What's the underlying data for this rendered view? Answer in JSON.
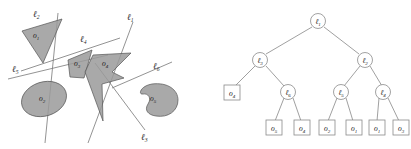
{
  "figure": {
    "left_panel": {
      "title": "bsp-arrangement",
      "objects": [
        {
          "id": "o1",
          "label": "o",
          "subscript": "1",
          "shape": "triangle",
          "x": 37,
          "y": 38
        },
        {
          "id": "o2",
          "label": "o",
          "subscript": "2",
          "shape": "ellipse",
          "x": 44,
          "y": 99
        },
        {
          "id": "o3",
          "label": "o",
          "subscript": "3",
          "shape": "triangle",
          "x": 79,
          "y": 63
        },
        {
          "id": "o4",
          "label": "o",
          "subscript": "4",
          "shape": "concave-arrow",
          "x": 107,
          "y": 63
        },
        {
          "id": "o5",
          "label": "o",
          "subscript": "5",
          "shape": "bean",
          "x": 155,
          "y": 98
        }
      ],
      "lines": [
        {
          "id": "l1",
          "label": "ℓ",
          "subscript": "1",
          "x": 131,
          "y": 17
        },
        {
          "id": "l2",
          "label": "ℓ",
          "subscript": "2",
          "x": 38,
          "y": 14
        },
        {
          "id": "l3",
          "label": "ℓ",
          "subscript": "3",
          "x": 146,
          "y": 137
        },
        {
          "id": "l4",
          "label": "ℓ",
          "subscript": "4",
          "x": 85,
          "y": 39
        },
        {
          "id": "l5",
          "label": "ℓ",
          "subscript": "5",
          "x": 17,
          "y": 69
        },
        {
          "id": "l6",
          "label": "ℓ",
          "subscript": "6",
          "x": 158,
          "y": 66
        }
      ]
    },
    "right_panel": {
      "title": "bsp-tree",
      "internal_nodes": [
        {
          "id": "n-l1",
          "label": "ℓ",
          "subscript": "1",
          "cx": 113,
          "cy": 21
        },
        {
          "id": "n-l3",
          "label": "ℓ",
          "subscript": "3",
          "cx": 55,
          "cy": 60
        },
        {
          "id": "n-l2",
          "label": "ℓ",
          "subscript": "2",
          "cx": 160,
          "cy": 60
        },
        {
          "id": "n-l6",
          "label": "ℓ",
          "subscript": "6",
          "cx": 83,
          "cy": 92
        },
        {
          "id": "n-l5",
          "label": "ℓ",
          "subscript": "5",
          "cx": 136,
          "cy": 92
        },
        {
          "id": "n-l4",
          "label": "ℓ",
          "subscript": "4",
          "cx": 178,
          "cy": 92
        }
      ],
      "leaf_nodes": [
        {
          "id": "leaf-o4-a",
          "label": "o",
          "subscript": "4",
          "cx": 27,
          "cy": 93
        },
        {
          "id": "leaf-o5",
          "label": "o",
          "subscript": "5",
          "cx": 69,
          "cy": 128
        },
        {
          "id": "leaf-o4-b",
          "label": "o",
          "subscript": "4",
          "cx": 97,
          "cy": 128
        },
        {
          "id": "leaf-o2",
          "label": "o",
          "subscript": "2",
          "cx": 122,
          "cy": 128
        },
        {
          "id": "leaf-o1-a",
          "label": "o",
          "subscript": "1",
          "cx": 149,
          "cy": 128
        },
        {
          "id": "leaf-o1-b",
          "label": "o",
          "subscript": "1",
          "cx": 172,
          "cy": 128
        },
        {
          "id": "leaf-o3",
          "label": "o",
          "subscript": "3",
          "cx": 196,
          "cy": 128
        }
      ],
      "edges": [
        {
          "from": "n-l1",
          "to": "n-l3"
        },
        {
          "from": "n-l1",
          "to": "n-l2"
        },
        {
          "from": "n-l3",
          "to": "leaf-o4-a"
        },
        {
          "from": "n-l3",
          "to": "n-l6"
        },
        {
          "from": "n-l6",
          "to": "leaf-o5"
        },
        {
          "from": "n-l6",
          "to": "leaf-o4-b"
        },
        {
          "from": "n-l2",
          "to": "n-l5"
        },
        {
          "from": "n-l2",
          "to": "n-l4"
        },
        {
          "from": "n-l5",
          "to": "leaf-o2"
        },
        {
          "from": "n-l5",
          "to": "leaf-o1-a"
        },
        {
          "from": "n-l4",
          "to": "leaf-o1-b"
        },
        {
          "from": "n-l4",
          "to": "leaf-o3"
        }
      ]
    },
    "colors": {
      "object_fill": "#9a9a9a",
      "object_stroke": "#555555",
      "line_stroke": "#777777",
      "node_stroke": "#8a8a8a",
      "background": "#ffffff"
    }
  }
}
